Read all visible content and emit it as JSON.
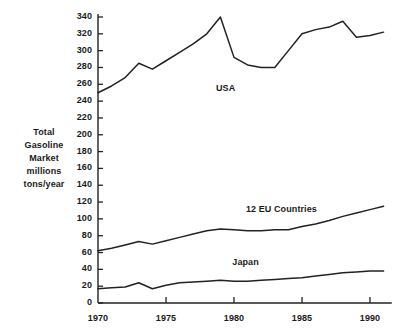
{
  "chart_data": {
    "type": "line",
    "title": "",
    "subtitle": "",
    "xlabel": "",
    "ylabel": "Total Gasoline Market millions tons/year",
    "ylabel_lines": [
      "Total",
      "Gasoline",
      "Market",
      "millions",
      "tons/year"
    ],
    "xlim": [
      1969,
      1991.5
    ],
    "ylim": [
      0,
      345
    ],
    "grid": false,
    "legend_position": "inline-annotations",
    "y_ticks": [
      0,
      20,
      40,
      60,
      80,
      100,
      120,
      140,
      160,
      180,
      200,
      220,
      240,
      260,
      280,
      300,
      320,
      340
    ],
    "y_tick_labels": [
      "0",
      "20",
      "40",
      "60",
      "80",
      "100",
      "120",
      "140",
      "160",
      "180",
      "200",
      "220",
      "240",
      "260",
      "280",
      "300",
      "320",
      "340"
    ],
    "x_ticks": [
      1970,
      1975,
      1980,
      1985,
      1990
    ],
    "x_tick_labels": [
      "1970",
      "1975",
      "1980",
      "1985",
      "1990"
    ],
    "x": [
      1970,
      1971,
      1972,
      1973,
      1974,
      1975,
      1976,
      1977,
      1978,
      1979,
      1980,
      1981,
      1982,
      1983,
      1984,
      1985,
      1986,
      1987,
      1988,
      1989,
      1990,
      1991
    ],
    "series": [
      {
        "name": "USA",
        "color": "#222222",
        "label_x": 1980.0,
        "label_y": 255,
        "values": [
          250,
          258,
          268,
          285,
          278,
          288,
          298,
          308,
          320,
          340,
          292,
          283,
          280,
          280,
          300,
          320,
          325,
          328,
          335,
          316,
          318,
          322
        ]
      },
      {
        "name": "12 EU Countries",
        "color": "#222222",
        "label_x": 1982.2,
        "label_y": 110,
        "values": [
          62,
          65,
          69,
          73,
          70,
          74,
          78,
          82,
          86,
          88,
          87,
          86,
          86,
          87,
          87,
          91,
          94,
          98,
          103,
          107,
          111,
          115
        ]
      },
      {
        "name": "Japan",
        "color": "#222222",
        "label_x": 1981.2,
        "label_y": 48,
        "values": [
          17,
          18,
          19,
          24,
          17,
          21,
          24,
          25,
          26,
          27,
          26,
          26,
          27,
          28,
          29,
          30,
          32,
          34,
          36,
          37,
          38,
          38
        ]
      }
    ]
  }
}
